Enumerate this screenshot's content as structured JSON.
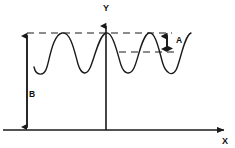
{
  "figure": {
    "background_color": "#ffffff",
    "stroke_color": "#1a1a1a",
    "width": 235,
    "height": 148
  },
  "axes": {
    "y_axis": {
      "label": "Y",
      "label_x": 106,
      "label_y": 11,
      "x": 106,
      "top": 22,
      "bottom": 130
    },
    "x_axis": {
      "label": "X",
      "label_x": 225,
      "label_y": 143,
      "y": 130,
      "left": 3,
      "right": 228
    }
  },
  "measurements": [
    {
      "name": "amplitude",
      "label": "A",
      "label_x": 178,
      "label_y": 42,
      "arrow_x": 167,
      "top_y": 33,
      "bottom_y": 52,
      "description": "Peak-to-trough amplitude between upper and lower dashed reference lines"
    },
    {
      "name": "offset",
      "label": "B",
      "label_x": 31,
      "label_y": 95,
      "arrow_x": 27,
      "top_y": 33,
      "bottom_y": 130,
      "description": "Vertical offset from the X axis up to the upper dashed peak line"
    }
  ],
  "reference_lines": [
    {
      "name": "peak-dashed-line",
      "y": 33,
      "x_start": 27,
      "x_end": 172,
      "style": "dashed"
    },
    {
      "name": "trough-dashed-line",
      "y": 52,
      "x_start": 119,
      "x_end": 176,
      "style": "dashed"
    }
  ],
  "chart_data": {
    "type": "line",
    "xlabel": "X",
    "ylabel": "Y",
    "grid": false,
    "legend": null,
    "annotations": [
      {
        "text": "A",
        "meaning": "amplitude (peak to trough)"
      },
      {
        "text": "B",
        "meaning": "offset of wave peak above X axis"
      },
      {
        "text": "Y",
        "meaning": "vertical axis"
      },
      {
        "text": "X",
        "meaning": "horizontal axis"
      }
    ],
    "series": [
      {
        "name": "wave",
        "peak_y_px": 33,
        "trough_y_px": 72,
        "x_start_px": 34,
        "x_end_px": 193,
        "period_px": 40,
        "cycles": 4,
        "path": "M 34,67 C 36,76 44,77 47,67 C 50,57 53,35 62,33 C 71,31 75,54 78,64 C 81,74 86,76 90,68 C 94,60 99,35 106,33 C 113,31 118,56 121,65 C 124,74 130,76 134,68 C 138,60 142,35 149,33 C 156,31 160,55 163,64 C 166,73 172,77 176,70 C 180,63 184,36 191,33"
      }
    ]
  }
}
